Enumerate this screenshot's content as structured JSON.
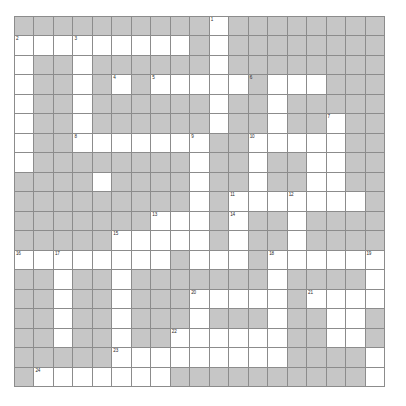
{
  "puzzle": {
    "type": "crossword-grid",
    "title": "Crossword Puzzle Grid",
    "rows": 19,
    "cols": 19,
    "colors": {
      "blocked_cell": "#c6c6c6",
      "open_cell": "#ffffff",
      "grid_line": "#8c8c8c",
      "number_text": "#2b2b2b",
      "page_background": "#ffffff"
    },
    "legend": {
      "blocked_label": "blocked cell",
      "open_label": "open cell"
    },
    "clue_numbers": [
      1,
      2,
      3,
      4,
      5,
      6,
      7,
      8,
      9,
      10,
      11,
      12,
      13,
      14,
      15,
      16,
      17,
      18,
      19,
      20,
      21,
      22,
      23,
      24
    ],
    "numbered_cells": [
      {
        "number": "1",
        "row": 0,
        "col": 10
      },
      {
        "number": "2",
        "row": 1,
        "col": 0
      },
      {
        "number": "3",
        "row": 1,
        "col": 3
      },
      {
        "number": "4",
        "row": 3,
        "col": 5
      },
      {
        "number": "5",
        "row": 3,
        "col": 7
      },
      {
        "number": "6",
        "row": 3,
        "col": 12
      },
      {
        "number": "7",
        "row": 5,
        "col": 16
      },
      {
        "number": "8",
        "row": 6,
        "col": 3
      },
      {
        "number": "9",
        "row": 6,
        "col": 9
      },
      {
        "number": "10",
        "row": 6,
        "col": 12
      },
      {
        "number": "11",
        "row": 9,
        "col": 11
      },
      {
        "number": "12",
        "row": 9,
        "col": 14
      },
      {
        "number": "13",
        "row": 10,
        "col": 7
      },
      {
        "number": "14",
        "row": 10,
        "col": 11
      },
      {
        "number": "15",
        "row": 11,
        "col": 5
      },
      {
        "number": "16",
        "row": 12,
        "col": 0
      },
      {
        "number": "17",
        "row": 12,
        "col": 2
      },
      {
        "number": "18",
        "row": 12,
        "col": 13
      },
      {
        "number": "19",
        "row": 12,
        "col": 18
      },
      {
        "number": "20",
        "row": 14,
        "col": 9
      },
      {
        "number": "21",
        "row": 14,
        "col": 15
      },
      {
        "number": "22",
        "row": 16,
        "col": 8
      },
      {
        "number": "23",
        "row": 17,
        "col": 5
      },
      {
        "number": "24",
        "row": 18,
        "col": 1
      }
    ],
    "grid": [
      [
        1,
        1,
        1,
        1,
        1,
        1,
        1,
        1,
        1,
        1,
        0,
        1,
        1,
        1,
        1,
        1,
        1,
        1,
        1
      ],
      [
        0,
        0,
        0,
        0,
        0,
        0,
        0,
        0,
        0,
        1,
        0,
        1,
        1,
        1,
        1,
        1,
        1,
        1,
        1
      ],
      [
        0,
        1,
        1,
        0,
        1,
        1,
        1,
        1,
        1,
        1,
        0,
        1,
        1,
        1,
        1,
        1,
        1,
        1,
        1
      ],
      [
        0,
        1,
        1,
        0,
        1,
        0,
        1,
        0,
        0,
        0,
        0,
        0,
        1,
        0,
        0,
        0,
        1,
        1,
        1
      ],
      [
        0,
        1,
        1,
        0,
        1,
        1,
        1,
        1,
        1,
        1,
        0,
        1,
        1,
        0,
        1,
        1,
        1,
        1,
        1
      ],
      [
        0,
        1,
        1,
        0,
        1,
        1,
        1,
        1,
        1,
        1,
        0,
        1,
        1,
        0,
        1,
        1,
        0,
        1,
        1
      ],
      [
        0,
        1,
        1,
        0,
        0,
        0,
        0,
        0,
        0,
        0,
        1,
        1,
        0,
        0,
        0,
        0,
        0,
        1,
        1
      ],
      [
        0,
        1,
        1,
        1,
        1,
        1,
        1,
        1,
        1,
        0,
        1,
        1,
        0,
        1,
        1,
        0,
        0,
        1,
        1
      ],
      [
        1,
        1,
        1,
        1,
        0,
        1,
        1,
        1,
        1,
        0,
        1,
        1,
        0,
        1,
        1,
        0,
        0,
        1,
        1
      ],
      [
        1,
        1,
        1,
        1,
        1,
        1,
        1,
        1,
        1,
        0,
        1,
        0,
        0,
        0,
        0,
        0,
        0,
        0,
        1
      ],
      [
        1,
        1,
        1,
        1,
        1,
        1,
        1,
        0,
        0,
        0,
        1,
        0,
        1,
        1,
        0,
        1,
        1,
        1,
        1
      ],
      [
        1,
        1,
        1,
        1,
        1,
        0,
        0,
        0,
        0,
        0,
        1,
        0,
        1,
        1,
        0,
        1,
        1,
        1,
        1
      ],
      [
        0,
        0,
        0,
        0,
        0,
        0,
        0,
        0,
        1,
        0,
        0,
        0,
        1,
        0,
        0,
        0,
        0,
        0,
        0
      ],
      [
        1,
        1,
        0,
        1,
        1,
        0,
        1,
        1,
        1,
        1,
        1,
        1,
        1,
        0,
        1,
        1,
        1,
        1,
        0
      ],
      [
        1,
        1,
        0,
        1,
        1,
        0,
        1,
        1,
        1,
        0,
        0,
        0,
        0,
        0,
        1,
        0,
        0,
        0,
        0
      ],
      [
        1,
        1,
        0,
        1,
        1,
        0,
        1,
        1,
        1,
        0,
        1,
        1,
        1,
        0,
        1,
        1,
        0,
        0,
        1
      ],
      [
        1,
        1,
        0,
        1,
        1,
        0,
        1,
        1,
        0,
        0,
        0,
        0,
        0,
        0,
        1,
        1,
        0,
        0,
        1
      ],
      [
        1,
        1,
        1,
        1,
        1,
        0,
        0,
        0,
        0,
        0,
        0,
        0,
        0,
        0,
        1,
        1,
        1,
        1,
        0
      ],
      [
        1,
        0,
        0,
        0,
        0,
        0,
        0,
        0,
        1,
        1,
        1,
        1,
        1,
        1,
        1,
        1,
        1,
        1,
        0
      ]
    ]
  }
}
